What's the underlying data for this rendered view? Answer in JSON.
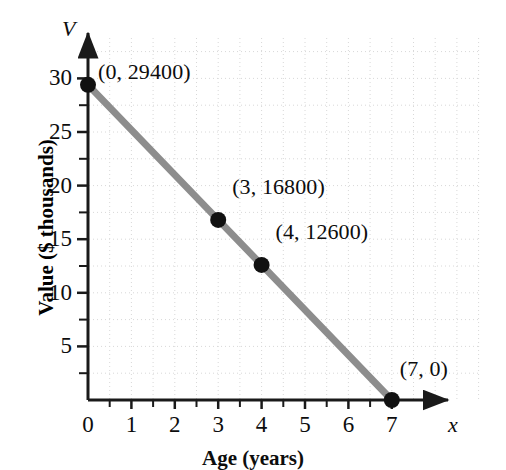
{
  "chart_data": {
    "type": "line",
    "title": "",
    "subtitle": "",
    "xlabel": "Age (years)",
    "ylabel": "Value ($ thousands)",
    "x_axis_variable": "x",
    "y_axis_variable": "V",
    "xlim": [
      0,
      7.6
    ],
    "ylim": [
      0,
      32
    ],
    "xticks": [
      0,
      1,
      2,
      3,
      4,
      5,
      6,
      7
    ],
    "xtick_labels": [
      "0",
      "1",
      "2",
      "3",
      "4",
      "5",
      "6",
      "7"
    ],
    "yticks": [
      5,
      10,
      15,
      20,
      25,
      30
    ],
    "ytick_labels": [
      "5",
      "10",
      "15",
      "20",
      "25",
      "30"
    ],
    "minor_tick_interval": 0.5,
    "grid": true,
    "grid_style": "dotted",
    "grid_interval_x": 0.5,
    "grid_interval_y": 2.5,
    "legend": "none",
    "line_color": "#8d8d8d",
    "marker_color": "#111111",
    "axis_color": "#1a1a1a",
    "grid_color": "#d8d8d8",
    "series": [
      {
        "name": "Value",
        "x": [
          0,
          3,
          4,
          7
        ],
        "y": [
          29.4,
          16.8,
          12.6,
          0
        ]
      }
    ],
    "points": [
      {
        "x": 0,
        "y": 29.4,
        "label": "(0, 29400)",
        "value_dollars": 29400
      },
      {
        "x": 3,
        "y": 16.8,
        "label": "(3, 16800)",
        "value_dollars": 16800
      },
      {
        "x": 4,
        "y": 12.6,
        "label": "(4, 12600)",
        "value_dollars": 12600
      },
      {
        "x": 7,
        "y": 0,
        "label": "(7, 0)",
        "value_dollars": 0
      }
    ],
    "annotations": [
      "(0, 29400)",
      "(3, 16800)",
      "(4, 12600)",
      "(7, 0)"
    ]
  }
}
